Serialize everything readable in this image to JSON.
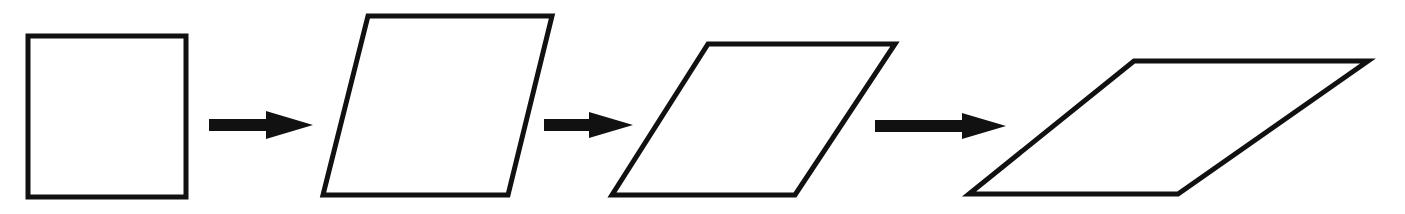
{
  "diagram": {
    "title": "",
    "colors": {
      "stroke": "#111111",
      "fill": "#ffffff",
      "background": "#ffffff"
    },
    "shapes": [
      {
        "name": "square",
        "points": "28,36 186,36 186,197 28,197"
      },
      {
        "name": "parallelogram-1",
        "points": "368,16 552,16 508,195 323,195"
      },
      {
        "name": "parallelogram-2",
        "points": "708,44 895,44 795,195 612,195"
      },
      {
        "name": "parallelogram-3",
        "points": "1134,61 1368,61 1178,194 969,194"
      }
    ],
    "arrows": [
      {
        "name": "arrow-1",
        "points": "209,119 266,119 266,111 313,125 266,139 266,131 209,131"
      },
      {
        "name": "arrow-2",
        "points": "544,119 589,119 589,112 633,125 589,138 589,131 544,131"
      },
      {
        "name": "arrow-3",
        "points": "875,120 962,120 962,113 1006,126 962,139 962,132 875,132"
      }
    ]
  }
}
